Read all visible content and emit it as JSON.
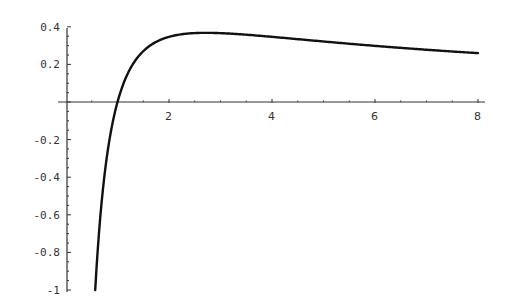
{
  "chart_data": {
    "type": "line",
    "title": "",
    "xlabel": "",
    "ylabel": "",
    "function": "ln(x)/x",
    "xlim": [
      0,
      8.2
    ],
    "ylim": [
      -1.0,
      0.4
    ],
    "grid": false,
    "legend": null,
    "x_ticks": [
      2,
      4,
      6,
      8
    ],
    "x_tick_labels": [
      "2",
      "4",
      "6",
      "8"
    ],
    "y_ticks": [
      0.4,
      0.2,
      -0.2,
      -0.4,
      -0.6,
      -0.8,
      -1
    ],
    "y_tick_labels": [
      "0.4",
      "0.2",
      "-0.2",
      "-0.4",
      "-0.6",
      "-0.8",
      "-1"
    ],
    "series": [
      {
        "name": "f(x)",
        "x": [
          0.567,
          0.6,
          0.7,
          0.8,
          0.9,
          1.0,
          1.2,
          1.4,
          1.6,
          1.8,
          2.0,
          2.4,
          2.718,
          3.0,
          3.5,
          4.0,
          4.5,
          5.0,
          5.5,
          6.0,
          6.5,
          7.0,
          7.5,
          8.0
        ],
        "values": [
          -1.0,
          -0.851,
          -0.51,
          -0.279,
          -0.117,
          0.0,
          0.152,
          0.24,
          0.294,
          0.327,
          0.347,
          0.365,
          0.368,
          0.366,
          0.358,
          0.347,
          0.334,
          0.322,
          0.31,
          0.299,
          0.288,
          0.278,
          0.269,
          0.26
        ]
      }
    ],
    "colors": {
      "line": "#111111",
      "axis": "#333333"
    }
  }
}
